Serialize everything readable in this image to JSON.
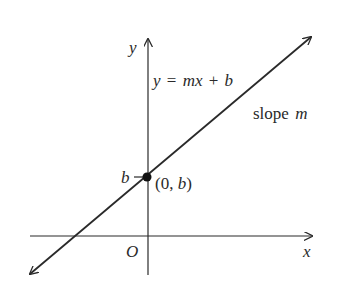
{
  "diagram": {
    "type": "slope-intercept line graph",
    "axes": {
      "x_label": "x",
      "y_label": "y",
      "origin_label": "O"
    },
    "line": {
      "equation_lhs": "y",
      "equation_eq": "=",
      "equation_mx": "mx",
      "equation_plus": "+",
      "equation_b": "b",
      "slope_text": "slope",
      "slope_var": "m"
    },
    "intercept": {
      "tick_label": "b",
      "point_label_open": "(0, ",
      "point_label_var": "b",
      "point_label_close": ")"
    },
    "colors": {
      "ink": "#2a2a2a",
      "background": "#ffffff"
    }
  }
}
